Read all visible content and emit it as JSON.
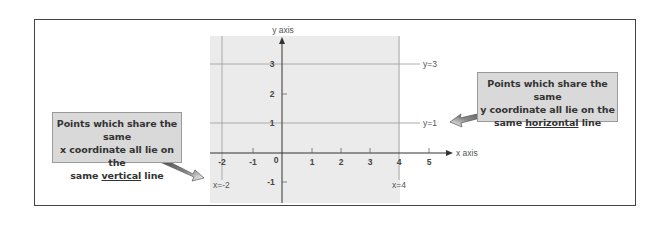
{
  "diagram": {
    "axes": {
      "x_label": "x axis",
      "y_label": "y axis",
      "origin_label": "0",
      "x_ticks": [
        "-2",
        "-1",
        "1",
        "2",
        "3",
        "4",
        "5"
      ],
      "y_ticks": [
        "3",
        "2",
        "1",
        "-1"
      ]
    },
    "lines": {
      "horizontal": [
        {
          "label": "y=3",
          "y": 3
        },
        {
          "label": "y=1",
          "y": 1
        }
      ],
      "vertical": [
        {
          "label": "x=-2",
          "x": -2
        },
        {
          "label": "x=4",
          "x": 4
        }
      ]
    },
    "callouts": {
      "left": {
        "line1": "Points which share the same",
        "line2": "x coordinate all lie on the",
        "line3_pre": "same ",
        "line3_em": "vertical",
        "line3_post": " line"
      },
      "right": {
        "line1": "Points which share the same",
        "line2": "y coordinate all lie on the",
        "line3_pre": "same ",
        "line3_em": "horizontal",
        "line3_post": " line"
      }
    },
    "colors": {
      "grid_background": "#ebebeb",
      "callout_background": "#d9d9d9",
      "axis": "#333333",
      "guide_line": "#9a9a9a",
      "frame": "#444444"
    }
  }
}
